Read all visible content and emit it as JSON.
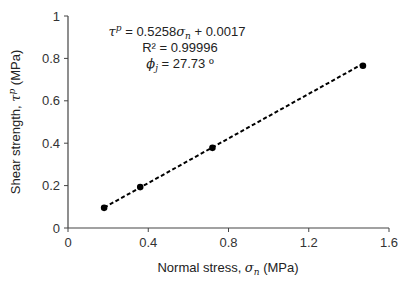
{
  "chart_data": {
    "type": "scatter",
    "title": "",
    "xlabel": "Normal stress, σn (MPa)",
    "ylabel": "Shear strength, τp (MPa)",
    "xlim": [
      0,
      1.6
    ],
    "ylim": [
      0,
      1
    ],
    "x_ticks": [
      0,
      0.4,
      0.8,
      1.2,
      1.6
    ],
    "y_ticks": [
      0,
      0.2,
      0.4,
      0.6,
      0.8,
      1
    ],
    "x_tick_labels": [
      "0",
      "0.4",
      "0.8",
      "1.2",
      "1.6"
    ],
    "y_tick_labels": [
      "0",
      "0.2",
      "0.4",
      "0.6",
      "0.8",
      "1"
    ],
    "grid": false,
    "legend": "none",
    "series": [
      {
        "name": "Measured",
        "marker": "circle",
        "color": "#000000",
        "x": [
          0.18,
          0.36,
          0.72,
          1.47
        ],
        "y": [
          0.095,
          0.193,
          0.378,
          0.765
        ]
      }
    ],
    "trendline": {
      "type": "linear",
      "style": "dashed",
      "color": "#000000",
      "slope": 0.5258,
      "intercept": 0.0017,
      "x_range": [
        0.18,
        1.47
      ]
    },
    "annotations": {
      "equation": {
        "lhs_symbol": "τ",
        "lhs_sup": "p",
        "rhs_prefix": " = 0.5258",
        "rhs_symbol": "σ",
        "rhs_sub": "n",
        "rhs_suffix": " + 0.0017"
      },
      "r_squared": "R² = 0.99996",
      "friction_angle": {
        "symbol": "ϕ",
        "sub": "j",
        "value": " = 27.73 º"
      }
    }
  },
  "axes": {
    "xlabel_prefix": "Normal stress, ",
    "xlabel_symbol": "σ",
    "xlabel_sub": "n",
    "xlabel_suffix": " (MPa)",
    "ylabel_prefix": "Shear strength, ",
    "ylabel_symbol": "τ",
    "ylabel_sup": "p",
    "ylabel_suffix": " (MPa)"
  }
}
